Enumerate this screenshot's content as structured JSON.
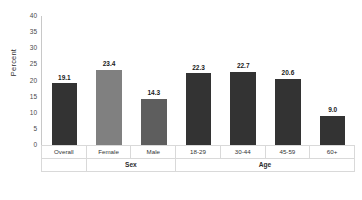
{
  "chart_data": {
    "type": "bar",
    "title": "",
    "xlabel": "",
    "ylabel": "Percent",
    "ylim": [
      0,
      40
    ],
    "yticks": [
      0,
      5,
      10,
      15,
      20,
      25,
      30,
      35,
      40
    ],
    "grid": false,
    "legend": "none",
    "categories": [
      "Overall",
      "Female",
      "Male",
      "18-29",
      "30-44",
      "45-59",
      "60+"
    ],
    "values": [
      19.1,
      23.4,
      14.3,
      22.3,
      22.7,
      20.6,
      9.0
    ],
    "value_labels": [
      "19.1",
      "23.4",
      "14.3",
      "22.3",
      "22.7",
      "20.6",
      "9.0"
    ],
    "bar_colors": [
      "#333333",
      "#808080",
      "#5e5e5e",
      "#333333",
      "#333333",
      "#333333",
      "#333333"
    ],
    "groups": [
      {
        "label": "",
        "span": 1
      },
      {
        "label": "Sex",
        "span": 2
      },
      {
        "label": "Age",
        "span": 4
      }
    ]
  },
  "axis": {
    "y_label": "Percent",
    "tick_labels": [
      "40",
      "35",
      "30",
      "25",
      "20",
      "15",
      "10",
      "5",
      "0"
    ]
  },
  "table": {
    "category_row": [
      "Overall",
      "Female",
      "Male",
      "18-29",
      "30-44",
      "45-59",
      "60+"
    ],
    "group_row": [
      "",
      "Sex",
      "Age"
    ]
  }
}
